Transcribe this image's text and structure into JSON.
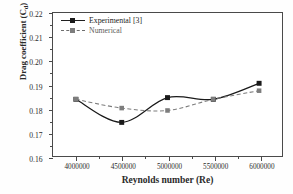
{
  "chart_data": {
    "type": "line",
    "title": "",
    "xlabel": "Reynolds number (Re)",
    "ylabel": "Drag coefficient (C",
    "ylabel_sub": "d",
    "ylabel_suffix": ")",
    "x": [
      4000000,
      4500000,
      5000000,
      5500000,
      6000000
    ],
    "xticklabels": [
      "4000000",
      "4500000",
      "5000000",
      "5500000",
      "6000000"
    ],
    "yticklabels": [
      "0.16",
      "0.17",
      "0.18",
      "0.19",
      "0.20",
      "0.21",
      "0.22"
    ],
    "xlim": [
      3750000,
      6250000
    ],
    "ylim": [
      0.16,
      0.22
    ],
    "grid": false,
    "legend_position": "upper-left",
    "series": [
      {
        "name": "Experimental [3]",
        "linestyle": "solid",
        "color": "#1a1a1a",
        "marker": "square-filled",
        "values": [
          0.1838,
          0.1741,
          0.1845,
          0.1838,
          0.1905
        ]
      },
      {
        "name": "Numerical",
        "linestyle": "dashed",
        "color": "#7d7d7d",
        "marker": "square-gray",
        "values": [
          0.1838,
          0.1801,
          0.1791,
          0.1838,
          0.1874
        ]
      }
    ]
  },
  "legend": {
    "items": [
      {
        "label": "Experimental [3]"
      },
      {
        "label": "Numerical"
      }
    ]
  },
  "colors": {
    "experimental": "#1a1a1a",
    "numerical": "#7d7d7d",
    "axis": "#4a4a4a",
    "background": "#ffffff"
  }
}
